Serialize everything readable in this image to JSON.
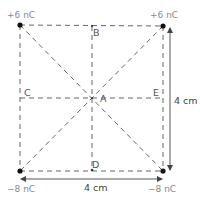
{
  "diagram": {
    "type": "square-charge-configuration",
    "charges": [
      {
        "id": "top-left",
        "label": "+6 nC",
        "x": 20,
        "y": 25
      },
      {
        "id": "top-right",
        "label": "+6 nC",
        "x": 163,
        "y": 26
      },
      {
        "id": "bottom-left",
        "label": "−8 nC",
        "x": 20,
        "y": 171
      },
      {
        "id": "bottom-right",
        "label": "−8 nC",
        "x": 163,
        "y": 171
      }
    ],
    "points": [
      {
        "id": "A",
        "label": "A",
        "x": 92,
        "y": 98
      },
      {
        "id": "B",
        "label": "B",
        "x": 92,
        "y": 26
      },
      {
        "id": "C",
        "label": "C",
        "x": 20,
        "y": 98
      },
      {
        "id": "D",
        "label": "D",
        "x": 92,
        "y": 170
      },
      {
        "id": "E",
        "label": "E",
        "x": 163,
        "y": 98
      }
    ],
    "dimensions": {
      "side_vertical": "4 cm",
      "side_horizontal": "4 cm"
    },
    "colors": {
      "line": "#555555",
      "dot": "#111111",
      "text": "#555555"
    }
  }
}
